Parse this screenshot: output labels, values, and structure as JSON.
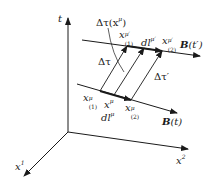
{
  "diagram": {
    "axes": {
      "t": {
        "label": "t"
      },
      "x1": {
        "label": "x",
        "sup": "1"
      },
      "x2": {
        "label": "x",
        "sup": "2"
      }
    },
    "lines": {
      "lower": {
        "label_bold": "B",
        "label_rest": "(t)"
      },
      "upper": {
        "label_bold": "B",
        "label_rest": "(t′)"
      }
    },
    "labels": {
      "delta_tau_x": {
        "pre": "Δτ(x",
        "sup": "μ",
        "post": ")"
      },
      "delta_tau": "Δτ",
      "delta_tau_prime": "Δτ′",
      "x1_prime": {
        "base": "x",
        "sup": "μ′",
        "sub": "(1)"
      },
      "dl_prime": {
        "base": "dl",
        "sup": "μ′"
      },
      "x2_prime": {
        "base": "x",
        "sup": "μ′",
        "sub": "(2)"
      },
      "x1_lower": {
        "base": "x",
        "sup": "μ",
        "sub": "(1)"
      },
      "x_mu": {
        "base": "x",
        "sup": "μ"
      },
      "x2_lower": {
        "base": "x",
        "sup": "μ",
        "sub": "(2)"
      },
      "dl": {
        "base": "dl",
        "sup": "μ"
      }
    },
    "colors": {
      "ink": "#1a1a1a",
      "background": "#ffffff"
    }
  }
}
